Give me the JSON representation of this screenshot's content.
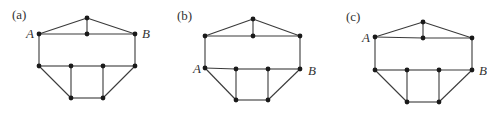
{
  "figure": {
    "panels": [
      {
        "id": "a",
        "label": "(a)",
        "label_pos": [
          12,
          19
        ],
        "nodes": [
          [
            39,
            34
          ],
          [
            87,
            18
          ],
          [
            87,
            34
          ],
          [
            135,
            34
          ],
          [
            39,
            66
          ],
          [
            71,
            66
          ],
          [
            103,
            66
          ],
          [
            135,
            66
          ],
          [
            71,
            98
          ],
          [
            103,
            98
          ]
        ],
        "edges": [
          [
            0,
            1
          ],
          [
            1,
            3
          ],
          [
            1,
            2
          ],
          [
            0,
            2
          ],
          [
            2,
            3
          ],
          [
            0,
            4
          ],
          [
            3,
            7
          ],
          [
            4,
            5
          ],
          [
            5,
            6
          ],
          [
            6,
            7
          ],
          [
            4,
            8
          ],
          [
            5,
            8
          ],
          [
            6,
            9
          ],
          [
            7,
            9
          ],
          [
            8,
            9
          ]
        ],
        "vertex_labels": [
          {
            "text": "A",
            "x": 26,
            "y": 38
          },
          {
            "text": "B",
            "x": 142,
            "y": 38
          }
        ]
      },
      {
        "id": "b",
        "label": "(b)",
        "label_pos": [
          177,
          20
        ],
        "nodes": [
          [
            205,
            36
          ],
          [
            253,
            19
          ],
          [
            253,
            36
          ],
          [
            300,
            36
          ],
          [
            205,
            68
          ],
          [
            236,
            69
          ],
          [
            268,
            69
          ],
          [
            300,
            69
          ],
          [
            236,
            100
          ],
          [
            268,
            100
          ]
        ],
        "edges": [
          [
            0,
            1
          ],
          [
            1,
            3
          ],
          [
            1,
            2
          ],
          [
            0,
            2
          ],
          [
            2,
            3
          ],
          [
            0,
            4
          ],
          [
            3,
            7
          ],
          [
            4,
            5
          ],
          [
            5,
            6
          ],
          [
            6,
            7
          ],
          [
            4,
            8
          ],
          [
            5,
            8
          ],
          [
            6,
            9
          ],
          [
            7,
            9
          ],
          [
            8,
            9
          ]
        ],
        "vertex_labels": [
          {
            "text": "A",
            "x": 193,
            "y": 73
          },
          {
            "text": "B",
            "x": 308,
            "y": 75
          }
        ]
      },
      {
        "id": "c",
        "label": "(c)",
        "label_pos": [
          346,
          21
        ],
        "nodes": [
          [
            375,
            37
          ],
          [
            423,
            22
          ],
          [
            423,
            38
          ],
          [
            472,
            38
          ],
          [
            375,
            70
          ],
          [
            407,
            70
          ],
          [
            439,
            70
          ],
          [
            472,
            70
          ],
          [
            407,
            102
          ],
          [
            439,
            102
          ]
        ],
        "edges": [
          [
            0,
            1
          ],
          [
            1,
            3
          ],
          [
            1,
            2
          ],
          [
            0,
            2
          ],
          [
            2,
            3
          ],
          [
            0,
            4
          ],
          [
            3,
            7
          ],
          [
            4,
            5
          ],
          [
            5,
            6
          ],
          [
            6,
            7
          ],
          [
            4,
            8
          ],
          [
            5,
            8
          ],
          [
            6,
            9
          ],
          [
            7,
            9
          ],
          [
            8,
            9
          ]
        ],
        "vertex_labels": [
          {
            "text": "A",
            "x": 362,
            "y": 42
          },
          {
            "text": "B",
            "x": 479,
            "y": 75
          }
        ]
      }
    ]
  }
}
